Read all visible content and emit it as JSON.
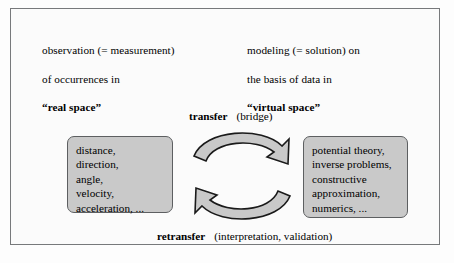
{
  "figure": {
    "border_color": "#77797b",
    "box_fill_color": "#c9c9c9",
    "box_border_color": "#5d5f61",
    "background_color": "#fbfbfb"
  },
  "header": {
    "left": {
      "line1": "observation (= measurement)",
      "line2": "of occurrences in",
      "emphasis": "“real space”"
    },
    "right": {
      "line1": "modeling (= solution) on",
      "line2": "the basis of data in",
      "emphasis": "“virtual space”"
    }
  },
  "boxes": {
    "real_space": {
      "name": "real-space-quantities",
      "lines": [
        "distance,",
        "direction,",
        "angle,",
        "velocity,",
        "acceleration, ..."
      ]
    },
    "virtual_space": {
      "name": "virtual-space-methods",
      "lines": [
        "potential theory,",
        "inverse problems,",
        "constructive",
        "approximation,",
        "numerics, ..."
      ]
    }
  },
  "arrows": {
    "top": {
      "label_bold": "transfer",
      "label_paren": "(bridge)",
      "direction": "left-to-right",
      "icon": "curved-arrow-right-icon"
    },
    "bottom": {
      "label_bold": "retransfer",
      "label_paren": "(interpretation, validation)",
      "direction": "right-to-left",
      "icon": "curved-arrow-left-icon"
    }
  }
}
